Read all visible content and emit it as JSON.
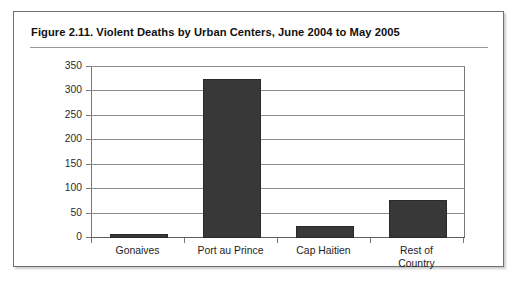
{
  "figure": {
    "title": "Figure 2.11.  Violent Deaths by Urban Centers, June 2004 to May 2005",
    "border_color": "#6f6f6f",
    "background": "#ffffff"
  },
  "chart_data": {
    "type": "bar",
    "title": "Violent Deaths by Urban Centers, June 2004 to May 2005",
    "figure_number": "Figure 2.11.",
    "categories": [
      "Gonaives",
      "Port au Prince",
      "Cap Haitien",
      "Rest of\nCountry"
    ],
    "values": [
      8,
      325,
      25,
      77
    ],
    "xlabel": "",
    "ylabel": "",
    "ylim": [
      0,
      350
    ],
    "ytick_step": 50,
    "yticks": [
      "350",
      "300",
      "250",
      "200",
      "150",
      "100",
      "50",
      "0"
    ],
    "grid": true,
    "legend": false,
    "bar_color": "#383838",
    "gridline_color": "#8d8d8d",
    "axis_color": "#787878"
  }
}
